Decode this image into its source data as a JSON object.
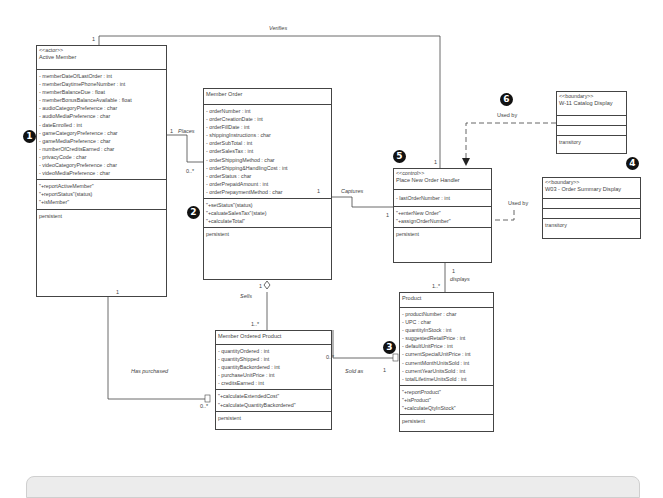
{
  "classes": {
    "active_member": {
      "stereotype": "<<actor>>",
      "name": "Active Member",
      "attributes": [
        "- memberDateOfLastOrder : int",
        "- memberDaytimePhoneNumber : int",
        "- memberBalanceDue : float",
        "- memberBonusBalanceAvailable : float",
        "- audioCategoryPreference : char",
        "- audioMediaPreference : char",
        "- dateEnrolled : int",
        "- gameCategoryPreference : char",
        "- gameMediaPreference : char",
        "- numberOfCreditsEarned : char",
        "- privacyCode : char",
        "- videoCategoryPreference : char",
        "- videoMediaPreference : char"
      ],
      "methods": [
        "\"+reportActiveMember\"",
        "\"+reportStatus\"(status)",
        "\"+isMember\""
      ],
      "persistence": "persistent"
    },
    "member_order": {
      "name": "Member Order",
      "attributes": [
        "- orderNumber : int",
        "- orderCreationDate : int",
        "- orderFillDate : int",
        "- shippingInstructions : char",
        "- orderSubTotal : int",
        "- orderSalesTax : int",
        "- orderShippingMethod : char",
        "- orderShipping&HandlingCost : int",
        "- orderStatus : char",
        "- orderPrepaidAmount : int",
        "- orderPrepaymentMethod : char"
      ],
      "methods": [
        "\"+setStatus\"(status)",
        "\"+caluateSalesTax\"(state)",
        "\"+calculateTotal\""
      ],
      "persistence": "persistent"
    },
    "member_ordered_product": {
      "name": "Member Ordered Product",
      "attributes": [
        "- quantityOrdered : int",
        "- quantityShipped : int",
        "- quantityBackordered : int",
        "- purchaseUnitPrice : int",
        "- creditsEarned : int"
      ],
      "methods": [
        "\"+calculateExtendedCost\"",
        "\"+calculateQuantityBackordered\""
      ],
      "persistence": "persistent"
    },
    "place_new_order_handler": {
      "stereotype": "<<control>>",
      "name": "Place New Order Handler",
      "attributes": [
        "- lastOrderNumber : int"
      ],
      "methods": [
        "\"+enterNew Order\"",
        "\"+assignOrderNumber\""
      ],
      "persistence": "persistent"
    },
    "product": {
      "name": "Product",
      "attributes": [
        "- productNumber : char",
        "- UPC : char",
        "- quantityInStock : int",
        "- suggestedRetailPrice : int",
        "- defaultUnitPrice : int",
        "- currentSpecialUnitPrice : int",
        "- currentMonthUnitsSold : int",
        "- currentYearUnitsSold : int",
        "- totalLifetimeUnitsSold : int"
      ],
      "methods": [
        "\"+reportProduct\"",
        "\"+isProduct\"",
        "\"+calculateQtyInStock\""
      ],
      "persistence": "persistent"
    },
    "catalog_display": {
      "stereotype": "<<boundary>>",
      "name": "W-11 Catalog Display",
      "persistence": "transitory"
    },
    "order_summary_display": {
      "stereotype": "<<boundary>>",
      "name": "W03 - Order Summary Display",
      "persistence": "transitory"
    }
  },
  "associations": {
    "verifies": "Verifies",
    "places": "Places",
    "captures": "Captures",
    "sells": "Sells",
    "has_purchased": "Has purchased",
    "sold_as": "Sold as",
    "displays": "displays",
    "used_by_1": "Used by",
    "used_by_2": "Used by"
  },
  "multiplicities": {
    "verifies_am": "1",
    "verifies_ph": "1",
    "places_am": "1",
    "places_mo": "0..*",
    "captures_mo": "1",
    "captures_ph": "1",
    "sells_mo": "1",
    "sells_mop": "1..*",
    "haspurch_am": "1",
    "haspurch_mop": "0..*",
    "soldas_mop": "0..*",
    "soldas_p": "1",
    "displays_ph": "1",
    "displays_p": "1..*"
  },
  "badges": [
    "1",
    "2",
    "3",
    "4",
    "5",
    "6"
  ]
}
